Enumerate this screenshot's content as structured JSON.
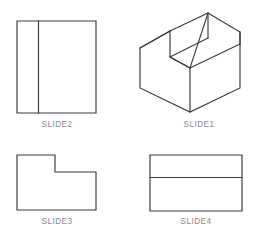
{
  "sheet": {
    "background_color": "#ffffff",
    "line_color": "#3a3a3a",
    "caption_color": "#8a8a8a",
    "width": 258,
    "height": 238
  },
  "views": [
    {
      "id": "slide2",
      "caption": "SLIDE2",
      "projection": "orthographic-front",
      "caption_x": 57,
      "caption_y": 127,
      "outline": "17,21 96,21 96,113 17,113",
      "edges": [
        "M 38.5 21 L 38.5 113"
      ]
    },
    {
      "id": "slide1",
      "caption": "SLIDE1",
      "projection": "isometric",
      "caption_x": 199,
      "caption_y": 127,
      "outline": "208,13 240,32 240,88 190,112 140,88 140,48 170,31 170,57 190,68",
      "edges": [
        "M 170 31 L 208 13",
        "M 170 57 L 208 38",
        "M 208 13 L 208 38",
        "M 190 68 L 240 44",
        "M 190 68 L 190 112",
        "M 240 32 L 240 44",
        "M 170 31 L 140 48",
        "M 170 57 L 190 68"
      ]
    },
    {
      "id": "slide3",
      "caption": "SLIDE3",
      "projection": "orthographic-side",
      "caption_x": 57,
      "caption_y": 224,
      "outline": "17,155 55,155 55,172 96,172 96,210 17,210",
      "edges": []
    },
    {
      "id": "slide4",
      "caption": "SLIDE4",
      "projection": "orthographic-top",
      "caption_x": 196,
      "caption_y": 224,
      "outline": "150,155 242,155 242,211 150,211",
      "edges": [
        "M 150 177.5 L 242 177.5"
      ]
    }
  ]
}
